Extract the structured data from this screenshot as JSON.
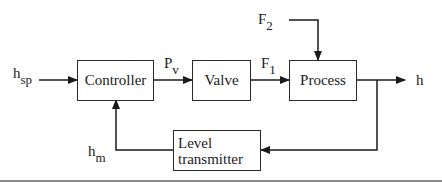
{
  "diagram": {
    "type": "block-diagram",
    "blocks": {
      "controller": "Controller",
      "valve": "Valve",
      "process": "Process",
      "level_transmitter_line1": "Level",
      "level_transmitter_line2": "transmitter"
    },
    "signals": {
      "setpoint": {
        "base": "h",
        "sub": "sp"
      },
      "controller_output": {
        "base": "P",
        "sub": "v"
      },
      "valve_flow": {
        "base": "F",
        "sub": "1"
      },
      "disturbance_flow": {
        "base": "F",
        "sub": "2"
      },
      "output": {
        "base": "h",
        "sub": ""
      },
      "measured": {
        "base": "h",
        "sub": "m"
      }
    },
    "connections": [
      {
        "from": "h_sp",
        "to": "Controller"
      },
      {
        "from": "Controller",
        "to": "Valve",
        "label": "P_v"
      },
      {
        "from": "Valve",
        "to": "Process",
        "label": "F_1"
      },
      {
        "from": "F_2",
        "to": "Process"
      },
      {
        "from": "Process",
        "to": "h"
      },
      {
        "from": "Process output",
        "to": "Level transmitter"
      },
      {
        "from": "Level transmitter",
        "to": "Controller",
        "label": "h_m"
      }
    ],
    "colors": {
      "stroke": "#2a2a2a",
      "background": "#ffffff",
      "rule": "#8a8a8a"
    }
  }
}
